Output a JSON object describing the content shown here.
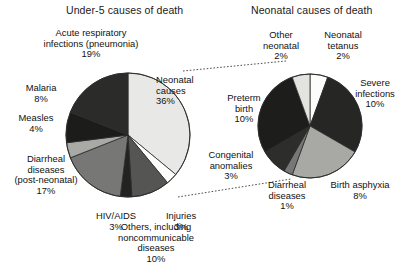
{
  "titles": {
    "left": "Under-5 causes of death",
    "right": "Neonatal causes of death"
  },
  "labels": {
    "ari": {
      "name": "Acute respiratory\ninfections (pneumonia)",
      "line1": "Acute respiratory",
      "line2": "infections (pneumonia)",
      "pct": "19%"
    },
    "malaria": {
      "line1": "Malaria",
      "pct": "8%"
    },
    "measles": {
      "line1": "Measles",
      "pct": "4%"
    },
    "diarrheal_left": {
      "line1": "Diarrheal",
      "line2": "diseases",
      "line3": "(post-neonatal)",
      "pct": "17%"
    },
    "hiv": {
      "line1": "HIV/AIDS",
      "pct": "3%"
    },
    "others": {
      "line1": "Others, including",
      "line2": "noncommunicable",
      "line3": "diseases",
      "pct": "10%"
    },
    "injuries": {
      "line1": "Injuries",
      "pct": "3%"
    },
    "neonatal": {
      "line1": "Neonatal",
      "line2": "causes",
      "pct": "36%"
    },
    "other_neonatal": {
      "line1": "Other",
      "line2": "neonatal",
      "pct": "2%"
    },
    "tetanus": {
      "line1": "Neonatal",
      "line2": "tetanus",
      "pct": "2%"
    },
    "severe_inf": {
      "line1": "Severe",
      "line2": "infections",
      "pct": "10%"
    },
    "asphyxia": {
      "line1": "Birth asphyxia",
      "pct": "8%"
    },
    "diarrheal_neo": {
      "line1": "Diarrheal",
      "line2": "diseases",
      "pct": "1%"
    },
    "congenital": {
      "line1": "Congenital",
      "line2": "anomalies",
      "pct": "3%"
    },
    "preterm": {
      "line1": "Preterm",
      "line2": "birth",
      "pct": "10%"
    }
  },
  "chart_data": [
    {
      "type": "pie",
      "title": "Under-5 causes of death",
      "id": "under5",
      "units": "percent of under-5 deaths",
      "center": [
        128,
        135
      ],
      "radius": 62,
      "start_angle_deg": 0,
      "direction": "clockwise",
      "categories": [
        "Neonatal causes",
        "Injuries",
        "Others, including noncommunicable diseases",
        "HIV/AIDS",
        "Diarrheal diseases (post-neonatal)",
        "Measles",
        "Malaria",
        "Acute respiratory infections (pneumonia)"
      ],
      "values": [
        36,
        3,
        10,
        3,
        17,
        4,
        8,
        19
      ],
      "colors": [
        "#e8e8e6",
        "#fdfdfc",
        "#555553",
        "#232322",
        "#777775",
        "#a9a9a6",
        "#1c1c1b",
        "#2b2b2a"
      ]
    },
    {
      "type": "pie",
      "title": "Neonatal causes of death",
      "id": "neonatal",
      "units": "percent of under-5 deaths (exploded from the 36% neonatal slice)",
      "center": [
        310,
        126
      ],
      "radius": 52,
      "start_angle_deg": 0,
      "direction": "clockwise",
      "categories": [
        "Neonatal tetanus",
        "Severe infections",
        "Birth asphyxia",
        "Diarrheal diseases",
        "Congenital anomalies",
        "Preterm birth",
        "Other neonatal"
      ],
      "values": [
        2,
        10,
        8,
        1,
        3,
        10,
        2
      ],
      "colors": [
        "#fcfcfb",
        "#262625",
        "#a8a8a5",
        "#777775",
        "#2d2d2c",
        "#1d1d1c",
        "#e3e3e0"
      ]
    }
  ],
  "connectors": {
    "upper": {
      "x1": 183,
      "y1": 71,
      "x2": 286,
      "y2": 61
    },
    "lower": {
      "x1": 178,
      "y1": 197,
      "x2": 291,
      "y2": 179
    }
  },
  "colors": {
    "background": "#ffffff",
    "text": "#111111",
    "outline": "#2a2a2a"
  }
}
